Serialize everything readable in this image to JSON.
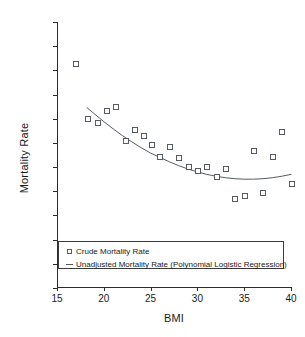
{
  "chart_data": {
    "type": "scatter",
    "title": "",
    "xlabel": "BMI",
    "ylabel": "Mortality Rate",
    "xlim": [
      15,
      40
    ],
    "ylim": [
      0.05,
      0.6
    ],
    "grid": false,
    "legend_position": "bottom-left",
    "xticks": [
      "15",
      "20",
      "25",
      "30",
      "35",
      "40"
    ],
    "xtick_values": [
      15,
      20,
      25,
      30,
      35,
      40
    ],
    "yticks": [
      "0.60",
      "0.55",
      "0.50",
      "0.45",
      "0.40",
      "0.35",
      "0.30",
      "0.25",
      "0.20",
      "0.15",
      "0.10",
      "0.05"
    ],
    "ytick_values": [
      0.6,
      0.55,
      0.5,
      0.45,
      0.4,
      0.35,
      0.3,
      0.25,
      0.2,
      0.15,
      0.1,
      0.05
    ],
    "series": [
      {
        "name": "Crude Mortality Rate",
        "marker": "open-square",
        "type": "scatter",
        "color": "#555b60",
        "x": [
          17.0,
          18.3,
          19.3,
          20.3,
          21.3,
          22.3,
          23.3,
          24.2,
          25.1,
          26.0,
          27.0,
          28.0,
          29.0,
          30.0,
          31.0,
          32.0,
          33.0,
          34.0,
          35.0,
          36.0,
          37.0,
          38.0,
          39.0,
          40.0
        ],
        "values": [
          0.515,
          0.4,
          0.393,
          0.416,
          0.426,
          0.356,
          0.378,
          0.366,
          0.346,
          0.321,
          0.343,
          0.319,
          0.301,
          0.292,
          0.302,
          0.281,
          0.297,
          0.236,
          0.241,
          0.335,
          0.248,
          0.322,
          0.374,
          0.267
        ]
      },
      {
        "name": "Unadjusted Mortality Rate (Polynomial Logistic Regression)",
        "marker": "line",
        "type": "line",
        "color": "#555b60",
        "x": [
          18.2,
          19.0,
          20.0,
          21.0,
          22.0,
          23.0,
          24.0,
          25.0,
          26.0,
          27.0,
          28.0,
          29.0,
          30.0,
          31.0,
          32.0,
          33.0,
          34.0,
          35.0,
          36.0,
          37.0,
          38.0,
          39.0,
          40.0
        ],
        "values": [
          0.423,
          0.41,
          0.394,
          0.379,
          0.365,
          0.352,
          0.34,
          0.329,
          0.32,
          0.311,
          0.303,
          0.296,
          0.29,
          0.285,
          0.281,
          0.278,
          0.276,
          0.275,
          0.275,
          0.276,
          0.278,
          0.281,
          0.285
        ]
      }
    ]
  },
  "legend": {
    "entries": [
      {
        "symbol": "open-square",
        "label": "Crude Mortality Rate"
      },
      {
        "symbol": "line",
        "label": "Unadjusted Mortality Rate (Polynomial Logistic Regression)"
      }
    ]
  },
  "colors": {
    "axis": "#2b2b2b",
    "marker": "#555b60",
    "line": "#555b60",
    "background": "#ffffff"
  }
}
